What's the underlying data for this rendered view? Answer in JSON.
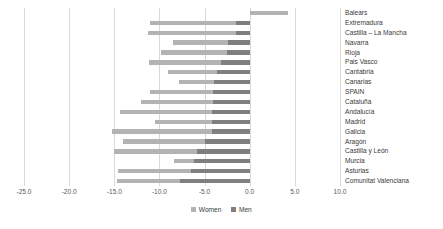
{
  "chart_data": {
    "type": "bar",
    "orientation": "horizontal",
    "title": "",
    "xlabel": "",
    "ylabel": "",
    "xlim": [
      -25.0,
      10.0
    ],
    "xticks": [
      "-25.0",
      "-20.0",
      "-15.0",
      "-10.0",
      "-5.0",
      "0.0",
      "5.0",
      "10.0"
    ],
    "xtick_values": [
      -25.0,
      -20.0,
      -15.0,
      -10.0,
      -5.0,
      0.0,
      5.0,
      10.0
    ],
    "grid": true,
    "legend_position": "bottom-center",
    "categories": [
      "Balears",
      "Extremadura",
      "Castilla – La Mancha",
      "Navarra",
      "Rioja",
      "Pais Vasco",
      "Cantabria",
      "Canarias",
      "SPAIN",
      "Cataluña",
      "Andalucía",
      "Madrid",
      "Galicia",
      "Aragón",
      "Castilla y León",
      "Murcia",
      "Asturias",
      "Comunitat Valenciana"
    ],
    "series": [
      {
        "name": "Women",
        "color": "#b3b3b3",
        "values": [
          4.2,
          -11.0,
          -11.3,
          -8.5,
          -9.8,
          -11.2,
          -9.0,
          -7.8,
          -11.0,
          -12.0,
          -14.4,
          -10.5,
          -15.2,
          -14.0,
          -15.0,
          -8.4,
          -14.6,
          -14.7
        ]
      },
      {
        "name": "Men",
        "color": "#7f7f7f",
        "values": [
          0.0,
          -1.5,
          -1.5,
          -2.4,
          -2.5,
          -3.2,
          -3.6,
          -4.0,
          -4.1,
          -4.1,
          -4.2,
          -4.2,
          -4.2,
          -5.0,
          -5.8,
          -6.2,
          -6.5,
          -7.7
        ]
      }
    ]
  },
  "legend": {
    "items": [
      {
        "label": "Women",
        "color": "#b3b3b3"
      },
      {
        "label": "Men",
        "color": "#7f7f7f"
      }
    ]
  }
}
